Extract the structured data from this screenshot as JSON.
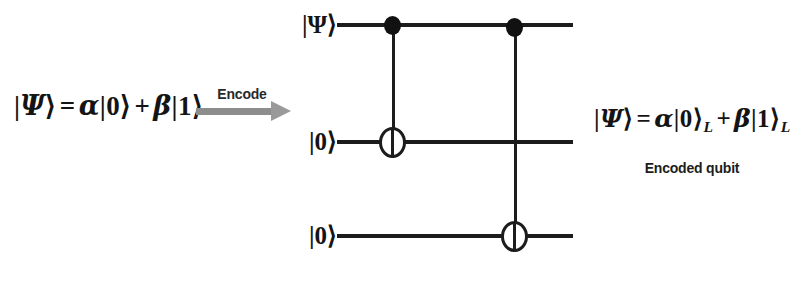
{
  "figure": {
    "type": "quantum-circuit-diagram",
    "background_color": "#ffffff",
    "ink_color": "#1c1c1c",
    "arrow_color": "#8d8d8d"
  },
  "input_state": {
    "ket_open": "|",
    "psi": "Ψ",
    "ket_close": "⟩",
    "equals": "=",
    "alpha": "α",
    "ket0": "|0⟩",
    "plus": "+",
    "beta": "β",
    "ket1": "|1⟩",
    "full_text": "|Ψ⟩ = α|0⟩ + β|1⟩"
  },
  "transform": {
    "label": "Encode",
    "arrow_direction": "right"
  },
  "output_state": {
    "psi": "Ψ",
    "equals": "=",
    "alpha": "α",
    "ket0": "|0⟩",
    "sub_l": "L",
    "plus": "+",
    "beta": "β",
    "ket1": "|1⟩",
    "full_text": "|Ψ⟩ = α|0⟩_L + β|1⟩_L",
    "caption": "Encoded qubit"
  },
  "circuit": {
    "wires": [
      {
        "label": "|Ψ⟩",
        "index": 0,
        "y": 25
      },
      {
        "label": "|0⟩",
        "index": 1,
        "y": 142
      },
      {
        "label": "|0⟩",
        "index": 2,
        "y": 236
      }
    ],
    "gates": [
      {
        "name": "cnot-1",
        "type": "CNOT",
        "control_wire": 0,
        "target_wire": 1,
        "x": 393
      },
      {
        "name": "cnot-2",
        "type": "CNOT",
        "control_wire": 0,
        "target_wire": 2,
        "x": 515
      }
    ]
  }
}
